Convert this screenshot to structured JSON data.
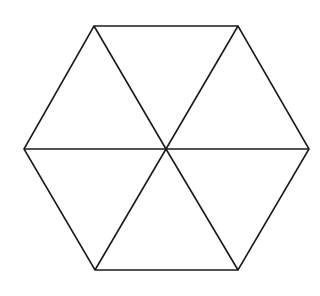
{
  "diagram": {
    "type": "hexagon-divided-into-triangles",
    "stroke_color": "#1a1a1a",
    "background_color": "#ffffff",
    "stroke_width": 1.6,
    "vertices": [
      {
        "name": "top-left",
        "x": 94,
        "y": 26
      },
      {
        "name": "top-right",
        "x": 238,
        "y": 26
      },
      {
        "name": "right",
        "x": 309,
        "y": 149
      },
      {
        "name": "bottom-right",
        "x": 238,
        "y": 270
      },
      {
        "name": "bottom-left",
        "x": 95,
        "y": 270
      },
      {
        "name": "left",
        "x": 24,
        "y": 149
      }
    ],
    "center": {
      "x": 166,
      "y": 149
    },
    "triangle_count": 6
  }
}
